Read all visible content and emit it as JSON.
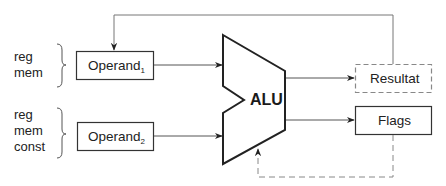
{
  "diagram": {
    "inputs": [
      {
        "sources": [
          "reg",
          "mem"
        ],
        "operand": {
          "base": "Operand",
          "subscript": "1"
        }
      },
      {
        "sources": [
          "reg",
          "mem",
          "const"
        ],
        "operand": {
          "base": "Operand",
          "subscript": "2"
        }
      }
    ],
    "alu": {
      "label": "ALU"
    },
    "outputs": [
      {
        "label": "Resultat",
        "style": "dashed"
      },
      {
        "label": "Flags",
        "style": "solid"
      }
    ],
    "connections": [
      {
        "from": "Operand1",
        "to": "ALU",
        "style": "solid"
      },
      {
        "from": "Operand2",
        "to": "ALU",
        "style": "solid"
      },
      {
        "from": "ALU",
        "to": "Resultat",
        "style": "solid"
      },
      {
        "from": "ALU",
        "to": "Flags",
        "style": "solid"
      },
      {
        "from": "Resultat",
        "to": "Operand1",
        "style": "solid"
      },
      {
        "from": "Flags",
        "to": "ALU",
        "style": "dashed"
      }
    ],
    "colors": {
      "stroke": "#333333",
      "line": "#555555",
      "dashed": "#888888",
      "text": "#222222"
    }
  }
}
